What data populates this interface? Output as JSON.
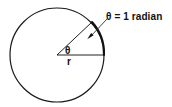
{
  "figure": {
    "title_text": "",
    "background_color": "#ffffff",
    "line_color": "#1a1a1a",
    "arc_color": "#111111",
    "labels": {
      "radian_annotation": "θ = 1 radian",
      "center_angle": "θ",
      "radius": "r"
    },
    "geometry": {
      "circle_center_x": 57,
      "circle_center_y": 55,
      "circle_radius": 47,
      "horizontal_radius_end_x": 104,
      "horizontal_radius_end_y": 55,
      "angled_radius_end_x": 92,
      "angled_radius_end_y": 22,
      "angle_degrees": 45,
      "arc_start_x": 104,
      "arc_start_y": 55,
      "arc_end_x": 92,
      "arc_end_y": 22,
      "arrow_tip_x": 88,
      "arrow_tip_y": 38,
      "arrow_tail_x": 107,
      "arrow_tail_y": 19
    },
    "icons": {
      "arrow": "arrow-pointer-icon",
      "arc": "arc-mark-icon"
    }
  }
}
